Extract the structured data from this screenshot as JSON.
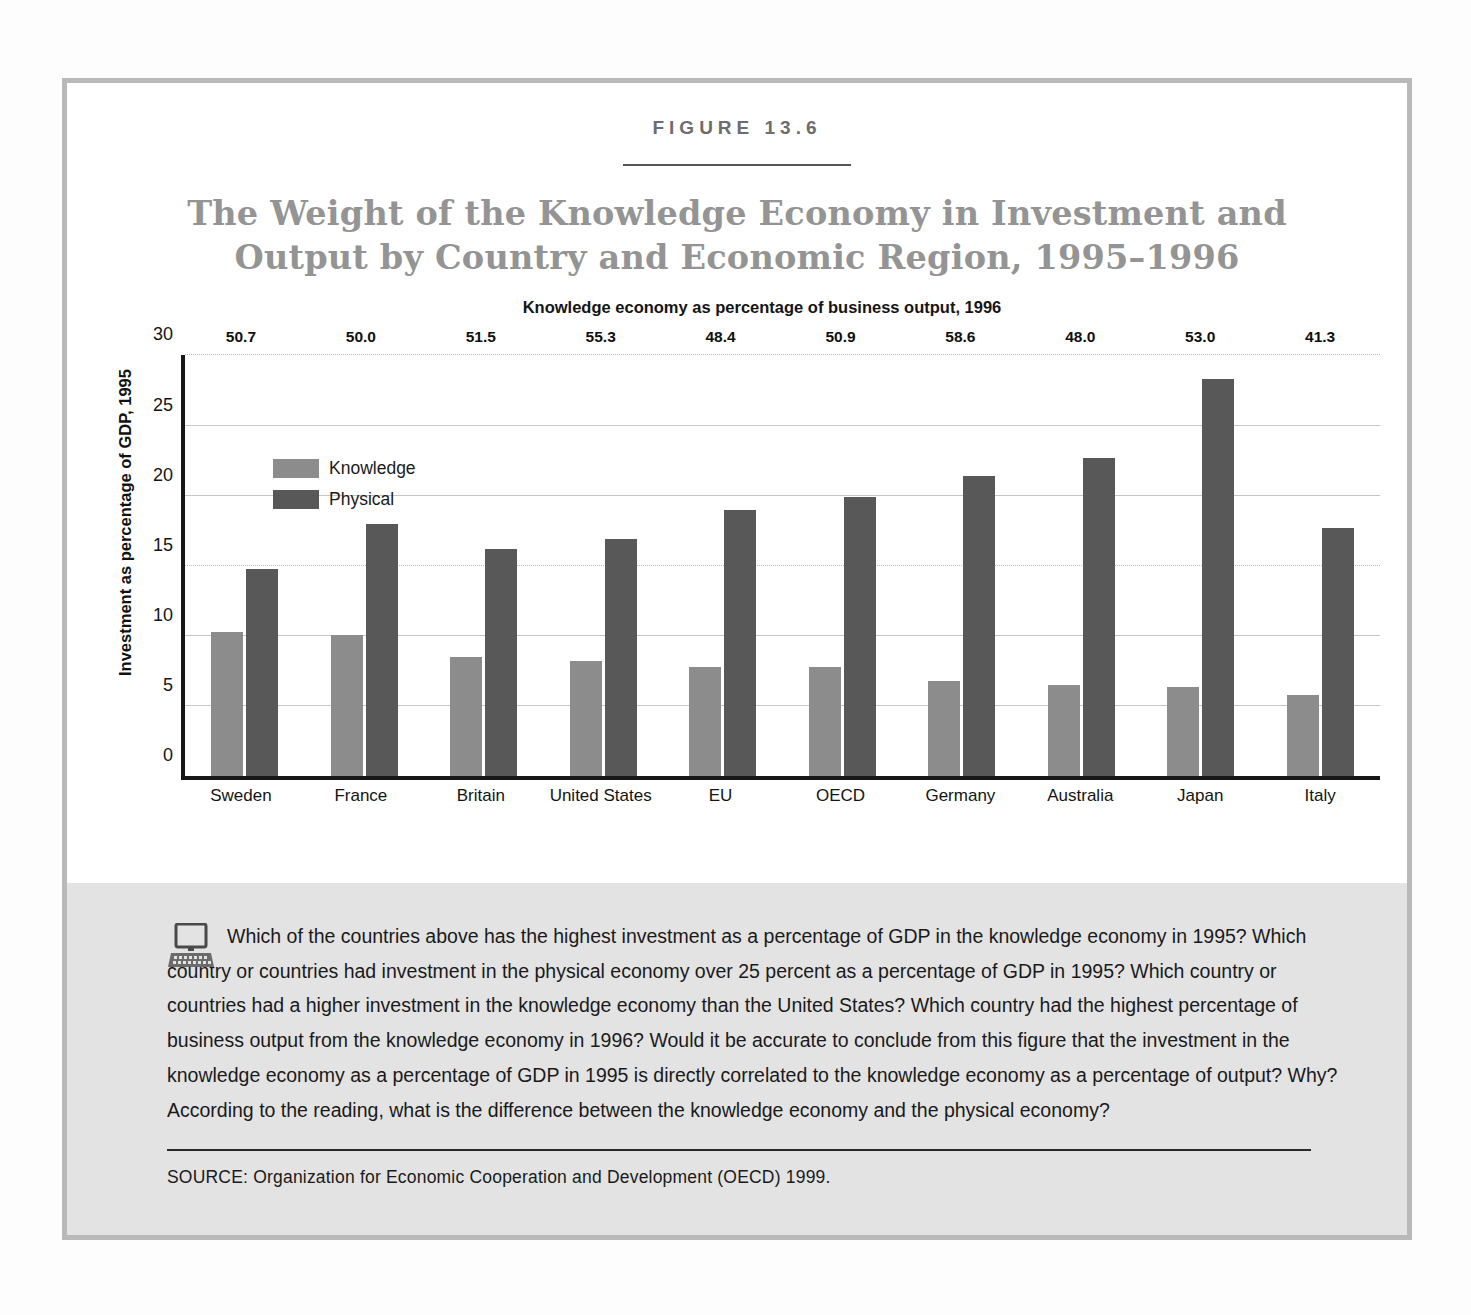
{
  "figure": {
    "number_label": "FIGURE 13.6",
    "title_line1": "The Weight of the Knowledge Economy in Investment and",
    "title_line2": "Output by Country and Economic Region, 1995–1996"
  },
  "caption": {
    "icon": "computer-icon",
    "body": "Which of the countries above has the highest investment as a percentage of GDP in the knowledge economy in 1995? Which country or countries had investment in the physical economy over 25 percent as a percentage of GDP in 1995? Which country or countries had a higher investment in the knowledge economy than the United States? Which country had the highest percentage of business output from the knowledge economy in 1996? Would it be accurate to conclude from this figure that the investment in the knowledge economy as a percentage of GDP in 1995 is directly correlated to the knowledge economy as a percentage of output? Why? According to the reading, what is the difference between the knowledge economy and the physical economy?",
    "source": "SOURCE:  Organization for Economic Cooperation and Development (OECD) 1999."
  },
  "colors": {
    "knowledge": "#8c8c8c",
    "physical": "#585858",
    "frame": "#b9b9b9",
    "caption_bg": "#e3e3e3",
    "title_text": "#949494"
  },
  "chart_data": {
    "type": "bar",
    "title": "The Weight of the Knowledge Economy in Investment and Output by Country and Economic Region, 1995–1996",
    "xlabel": "",
    "ylabel": "Investment as percentage of GDP, 1995",
    "top_axis_label": "Knowledge economy as percentage of business output, 1996",
    "ylim": [
      0,
      30
    ],
    "yticks": [
      0,
      5,
      10,
      15,
      20,
      25,
      30
    ],
    "grid": true,
    "legend_position": "upper-left-inside",
    "categories": [
      "Sweden",
      "France",
      "Britain",
      "United States",
      "EU",
      "OECD",
      "Germany",
      "Australia",
      "Japan",
      "Italy"
    ],
    "series": [
      {
        "name": "Knowledge",
        "values": [
          10.3,
          10.1,
          8.5,
          8.2,
          7.8,
          7.8,
          6.8,
          6.5,
          6.4,
          5.8
        ]
      },
      {
        "name": "Physical",
        "values": [
          14.8,
          18.0,
          16.2,
          16.9,
          19.0,
          19.9,
          21.4,
          22.7,
          28.3,
          17.7
        ]
      }
    ],
    "top_axis_values": [
      50.7,
      50.0,
      51.5,
      55.3,
      48.4,
      50.9,
      58.6,
      48.0,
      53.0,
      41.3
    ]
  }
}
